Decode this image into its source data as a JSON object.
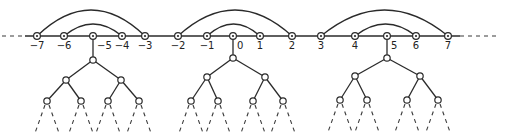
{
  "diagram": {
    "axis": {
      "y": 36,
      "x_start": 2,
      "x_end": 500,
      "dashed_ends": true
    },
    "nodes": [
      {
        "label": "-7",
        "x": 37
      },
      {
        "label": "-6",
        "x": 64
      },
      {
        "label": "-5",
        "x": 93
      },
      {
        "label": "-4",
        "x": 122
      },
      {
        "label": "-3",
        "x": 145
      },
      {
        "label": "-2",
        "x": 178
      },
      {
        "label": "-1",
        "x": 207
      },
      {
        "label": "0",
        "x": 233
      },
      {
        "label": "1",
        "x": 260
      },
      {
        "label": "2",
        "x": 292
      },
      {
        "label": "3",
        "x": 321
      },
      {
        "label": "4",
        "x": 355
      },
      {
        "label": "5",
        "x": 387
      },
      {
        "label": "6",
        "x": 416
      },
      {
        "label": "7",
        "x": 448
      }
    ],
    "arcs": [
      {
        "from": "-7",
        "to": "-3",
        "peak_y": 10
      },
      {
        "from": "-6",
        "to": "-4",
        "peak_y": 24
      },
      {
        "from": "-2",
        "to": "2",
        "peak_y": 10
      },
      {
        "from": "-1",
        "to": "1",
        "peak_y": 24
      },
      {
        "from": "3",
        "to": "7",
        "peak_y": 10
      },
      {
        "from": "4",
        "to": "6",
        "peak_y": 24
      }
    ],
    "trees": [
      {
        "attached_to": "-5",
        "root": [
          93,
          60
        ],
        "level2": [
          [
            66,
            80
          ],
          [
            121,
            80
          ]
        ],
        "level3": [
          [
            47,
            101
          ],
          [
            81,
            101
          ],
          [
            108,
            101
          ],
          [
            139,
            101
          ]
        ]
      },
      {
        "attached_to": "0",
        "root": [
          233,
          58
        ],
        "level2": [
          [
            207,
            77
          ],
          [
            265,
            77
          ]
        ],
        "level3": [
          [
            191,
            101
          ],
          [
            218,
            101
          ],
          [
            253,
            101
          ],
          [
            283,
            101
          ]
        ]
      },
      {
        "attached_to": "5",
        "root": [
          387,
          58
        ],
        "level2": [
          [
            355,
            76
          ],
          [
            420,
            76
          ]
        ],
        "level3": [
          [
            340,
            100
          ],
          [
            367,
            100
          ],
          [
            407,
            100
          ],
          [
            438,
            100
          ]
        ]
      }
    ],
    "leaf_dash_length": 32,
    "colors": {
      "ink": "#2a2a2a",
      "background": "#ffffff"
    }
  }
}
